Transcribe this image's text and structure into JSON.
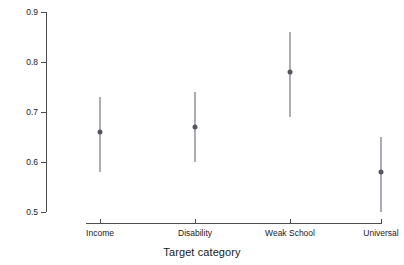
{
  "chart_data": {
    "type": "scatter",
    "title": "",
    "subtitle": "",
    "xlabel": "Target category",
    "ylabel": "Likelihood of voting in favor of voucher",
    "categories": [
      "Income",
      "Disability",
      "Weak School",
      "Universal"
    ],
    "values": [
      0.66,
      0.67,
      0.78,
      0.58
    ],
    "error_low": [
      0.58,
      0.6,
      0.69,
      0.5
    ],
    "error_high": [
      0.73,
      0.74,
      0.86,
      0.65
    ],
    "series": [
      {
        "name": "Likelihood of voting in favor of voucher",
        "points": [
          {
            "category": "Income",
            "estimate": 0.66,
            "lower": 0.58,
            "upper": 0.73
          },
          {
            "category": "Disability",
            "estimate": 0.67,
            "lower": 0.6,
            "upper": 0.74
          },
          {
            "category": "Weak School",
            "estimate": 0.78,
            "lower": 0.69,
            "upper": 0.86
          },
          {
            "category": "Universal",
            "estimate": 0.58,
            "lower": 0.5,
            "upper": 0.65
          }
        ]
      }
    ],
    "ylim": [
      0.5,
      0.9
    ],
    "yticks": [
      0.5,
      0.6,
      0.7,
      0.8,
      0.9
    ],
    "ytick_labels": [
      "0.5",
      "0.6",
      "0.7",
      "0.8",
      "0.9"
    ],
    "grid": false,
    "legend": "none",
    "legend_position": "none",
    "point_color": "#55555f",
    "range_color": "#5a5a6e",
    "axis_color": "#4d4d4d",
    "background_color": "#ffffff"
  }
}
